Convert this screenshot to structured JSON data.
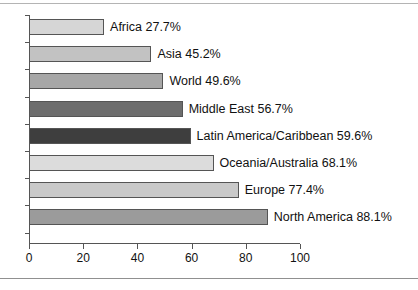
{
  "chart_data": {
    "type": "bar",
    "orientation": "horizontal",
    "title": "",
    "subtitle": "",
    "xlabel": "",
    "ylabel": "",
    "xlim": [
      0,
      100
    ],
    "xticks": [
      "0",
      "20",
      "40",
      "60",
      "80",
      "100"
    ],
    "grid": false,
    "legend": "none",
    "categories": [
      "Africa",
      "Asia",
      "World",
      "Middle East",
      "Latin America/Caribbean",
      "Oceania/Australia",
      "Europe",
      "North America"
    ],
    "values": [
      27.7,
      45.2,
      49.6,
      56.7,
      59.6,
      68.1,
      77.4,
      88.1
    ],
    "bars": [
      {
        "label": "Africa 27.7%",
        "category": "Africa",
        "value": 27.7,
        "color": "#d6d6d6"
      },
      {
        "label": "Asia 45.2%",
        "category": "Asia",
        "value": 45.2,
        "color": "#c2c2c2"
      },
      {
        "label": "World 49.6%",
        "category": "World",
        "value": 49.6,
        "color": "#a7a7a7"
      },
      {
        "label": "Middle East 56.7%",
        "category": "Middle East",
        "value": 56.7,
        "color": "#6d6d6d"
      },
      {
        "label": "Latin America/Caribbean 59.6%",
        "category": "Latin America/Caribbean",
        "value": 59.6,
        "color": "#3e3e3e"
      },
      {
        "label": "Oceania/Australia 68.1%",
        "category": "Oceania/Australia",
        "value": 68.1,
        "color": "#dcdcdc"
      },
      {
        "label": "Europe 77.4%",
        "category": "Europe",
        "value": 77.4,
        "color": "#c9c9c9"
      },
      {
        "label": "North America 88.1%",
        "category": "North America",
        "value": 88.1,
        "color": "#9b9b9b"
      }
    ]
  },
  "style": {
    "axis_color": "#555555",
    "bar_edge_color": "#555555",
    "text_color": "#111111",
    "rule_color": "#b4b4b4",
    "background": "#ffffff"
  }
}
